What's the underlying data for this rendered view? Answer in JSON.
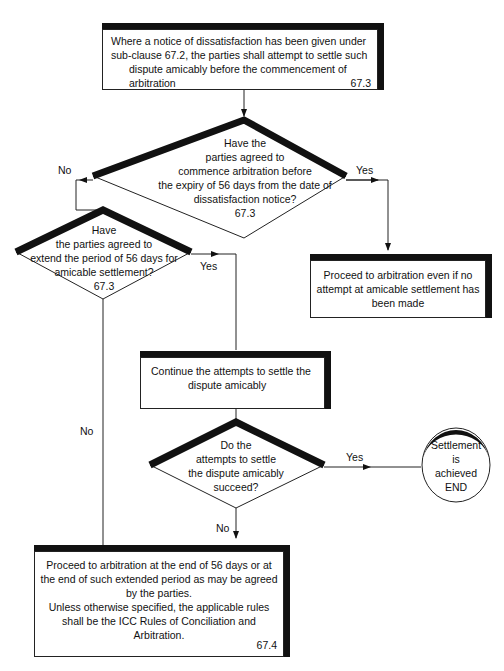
{
  "diagram": {
    "type": "flowchart",
    "nodes": {
      "start": {
        "lines": [
          "Where a notice of dissatisfaction has been given under",
          "sub-clause 67.2, the parties shall attempt to settle such",
          "dispute amicably before the commencement of",
          "arbitration"
        ],
        "ref": "67.3"
      },
      "decision_agreed_commence": {
        "lines": [
          "Have the",
          "parties agreed to",
          "commence arbitration before",
          "the expiry of 56 days from the date of",
          "dissatisfaction notice?",
          "67.3"
        ]
      },
      "proceed_immediate": {
        "lines": [
          "Proceed to arbitration even if no",
          "attempt at amicable settlement has",
          "been made"
        ]
      },
      "decision_extend": {
        "lines": [
          "Have",
          "the parties agreed to",
          "extend the period of 56 days for",
          "amicable settlement?",
          "67.3"
        ]
      },
      "continue_attempts": {
        "lines": [
          "Continue the attempts to settle the",
          "dispute amicably"
        ]
      },
      "decision_succeed": {
        "lines": [
          "Do the",
          "attempts to settle",
          "the dispute amicably",
          "succeed?"
        ]
      },
      "end": {
        "lines": [
          "Settlement",
          "is",
          "achieved",
          "END"
        ]
      },
      "proceed_end": {
        "lines": [
          "Proceed to arbitration at the end of 56 days or at",
          "the end of such extended period as may be agreed",
          "by the parties.",
          "Unless otherwise specified, the applicable rules",
          "shall be the ICC Rules of Conciliation and",
          "Arbitration."
        ],
        "ref": "67.4"
      }
    },
    "edges": {
      "d1_yes": "Yes",
      "d1_no": "No",
      "d2_yes": "Yes",
      "d2_no": "No",
      "d3_yes": "Yes",
      "d3_no": "No"
    },
    "colors": {
      "line": "#222222",
      "shadow": "#111111",
      "background": "#ffffff"
    }
  }
}
